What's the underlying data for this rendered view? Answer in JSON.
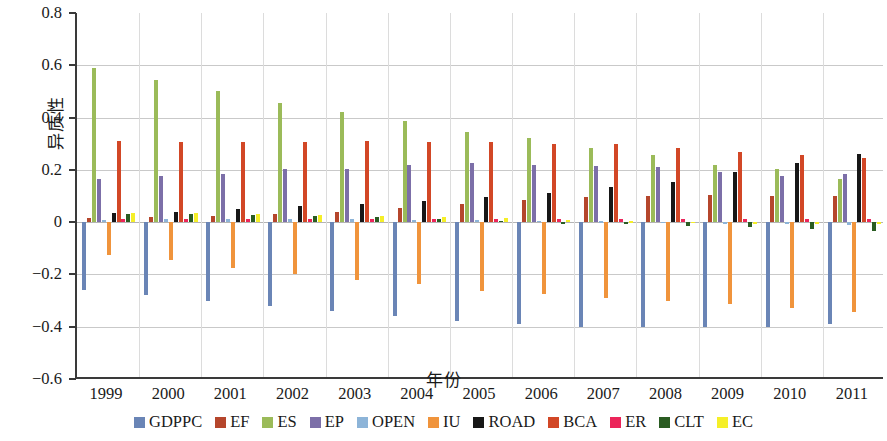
{
  "chart_data": {
    "type": "bar",
    "title": "",
    "xlabel": "年份",
    "ylabel": "异质性",
    "ylim": [
      -0.6,
      0.8
    ],
    "ytick_labels": [
      "0.8",
      "0.6",
      "0.4",
      "0.2",
      "0",
      "−0.2",
      "−0.4",
      "−0.6"
    ],
    "ytick_values": [
      0.8,
      0.6,
      0.4,
      0.2,
      0,
      -0.2,
      -0.4,
      -0.6
    ],
    "grid": true,
    "legend_position": "bottom",
    "categories": [
      "1999",
      "2000",
      "2001",
      "2002",
      "2003",
      "2004",
      "2005",
      "2006",
      "2007",
      "2008",
      "2009",
      "2010",
      "2011"
    ],
    "series": [
      {
        "name": "GDPPC",
        "color": "#6a85b6",
        "values": [
          -0.26,
          -0.28,
          -0.3,
          -0.32,
          -0.34,
          -0.36,
          -0.38,
          -0.39,
          -0.4,
          -0.4,
          -0.4,
          -0.4,
          -0.39
        ]
      },
      {
        "name": "EF",
        "color": "#b5462c",
        "values": [
          0.015,
          0.02,
          0.025,
          0.03,
          0.04,
          0.055,
          0.07,
          0.085,
          0.095,
          0.1,
          0.105,
          0.1,
          0.1
        ]
      },
      {
        "name": "ES",
        "color": "#9bbb59",
        "values": [
          0.59,
          0.545,
          0.5,
          0.455,
          0.42,
          0.385,
          0.345,
          0.32,
          0.285,
          0.255,
          0.22,
          0.205,
          0.165
        ]
      },
      {
        "name": "EP",
        "color": "#7c6fa8",
        "values": [
          0.165,
          0.175,
          0.185,
          0.205,
          0.205,
          0.22,
          0.225,
          0.22,
          0.215,
          0.21,
          0.19,
          0.175,
          0.185
        ]
      },
      {
        "name": "OPEN",
        "color": "#8 db4d8",
        "values": [
          0.01,
          0.012,
          0.012,
          0.012,
          0.012,
          0.01,
          0.008,
          0.005,
          0.003,
          0.002,
          0.0,
          -0.005,
          -0.012
        ]
      },
      {
        "name": "IU",
        "color": "#f0943c",
        "values": [
          -0.125,
          -0.145,
          -0.175,
          -0.2,
          -0.22,
          -0.235,
          -0.265,
          -0.275,
          -0.29,
          -0.3,
          -0.315,
          -0.33,
          -0.345
        ]
      },
      {
        "name": "ROAD",
        "color": "#171717",
        "values": [
          0.035,
          0.04,
          0.05,
          0.06,
          0.07,
          0.08,
          0.095,
          0.11,
          0.135,
          0.155,
          0.19,
          0.225,
          0.26
        ]
      },
      {
        "name": "BCA",
        "color": "#d24726",
        "values": [
          0.31,
          0.305,
          0.305,
          0.305,
          0.31,
          0.305,
          0.305,
          0.3,
          0.3,
          0.285,
          0.27,
          0.255,
          0.245
        ]
      },
      {
        "name": "ER",
        "color": "#ec255a",
        "values": [
          0.012,
          0.012,
          0.012,
          0.012,
          0.012,
          0.012,
          0.012,
          0.012,
          0.012,
          0.012,
          0.012,
          0.012,
          0.012
        ]
      },
      {
        "name": "CLT",
        "color": "#2a5c22",
        "values": [
          0.03,
          0.03,
          0.028,
          0.022,
          0.018,
          0.012,
          0.006,
          -0.006,
          -0.008,
          -0.014,
          -0.02,
          -0.026,
          -0.034
        ]
      },
      {
        "name": "EC",
        "color": "#f5ef28",
        "values": [
          0.035,
          0.035,
          0.03,
          0.028,
          0.022,
          0.02,
          0.015,
          0.008,
          0.004,
          0.002,
          0.0,
          0.0,
          0.0
        ]
      }
    ]
  },
  "axis": {
    "y_title": "异质性",
    "x_title": "年份"
  }
}
